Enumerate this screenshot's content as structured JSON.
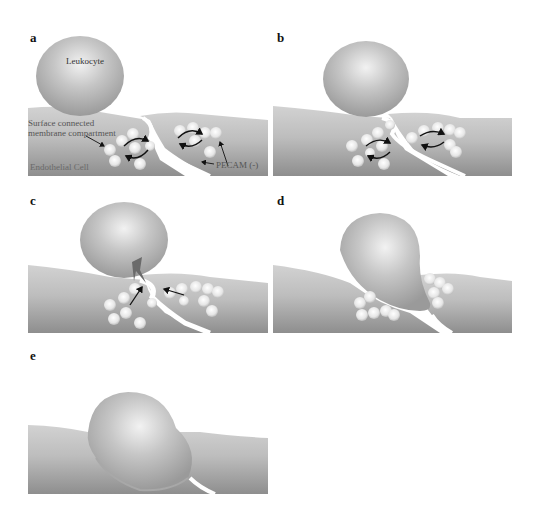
{
  "figure": {
    "panels": [
      {
        "id": "a",
        "letter": "a"
      },
      {
        "id": "b",
        "letter": "b"
      },
      {
        "id": "c",
        "letter": "c"
      },
      {
        "id": "d",
        "letter": "d"
      },
      {
        "id": "e",
        "letter": "e"
      }
    ],
    "labels": {
      "leukocyte": "Leukocyte",
      "surface_compartment_line1": "Surface connected",
      "surface_compartment_line2": "membrane compartment",
      "endothelial_cell": "Endothelial Cell",
      "pecam": "PECAM (-)"
    },
    "colors": {
      "background": "#ffffff",
      "cell_light": "#c9c9c9",
      "cell_dark": "#8f8f8f",
      "leukocyte": "#b5b5b5",
      "vesicle": "#ececec",
      "junction": "#ffffff",
      "arrow": "#111111",
      "signal": "#6a6a6a"
    }
  }
}
